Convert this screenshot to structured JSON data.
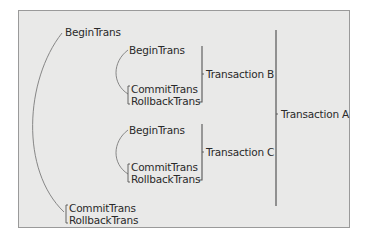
{
  "diagram": {
    "title": "",
    "colors": {
      "background": "#ffffff",
      "panel": "#e9e9e8",
      "panel_border": "#9a9a9a",
      "text": "#2a2a2a",
      "bracket": "#555555",
      "arc": "#7a7a7a"
    },
    "outer": {
      "begin": "BeginTrans",
      "commit": "CommitTrans",
      "rollback": "RollbackTrans",
      "label": "Transaction A"
    },
    "inner": [
      {
        "begin": "BeginTrans",
        "commit": "CommitTrans",
        "rollback": "RollbackTrans",
        "label": "Transaction B"
      },
      {
        "begin": "BeginTrans",
        "commit": "CommitTrans",
        "rollback": "RollbackTrans",
        "label": "Transaction C"
      }
    ]
  }
}
